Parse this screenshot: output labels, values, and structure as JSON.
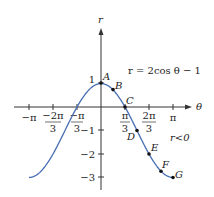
{
  "chart_data": {
    "type": "line",
    "title": "",
    "equation": "r = 2cos θ − 1",
    "xlabel": "θ",
    "ylabel": "r",
    "annotation": "r<0",
    "x_ticks": [
      {
        "value": -3.14159,
        "num": "−π",
        "den": ""
      },
      {
        "value": -2.0944,
        "num": "−2π",
        "den": "3"
      },
      {
        "value": -1.0472,
        "num": "−π",
        "den": "3"
      },
      {
        "value": 1.0472,
        "num": "π",
        "den": "3"
      },
      {
        "value": 2.0944,
        "num": "2π",
        "den": "3"
      },
      {
        "value": 3.14159,
        "num": "π",
        "den": ""
      }
    ],
    "y_ticks": [
      {
        "value": 1,
        "label": "1"
      },
      {
        "value": -1,
        "label": "−1"
      },
      {
        "value": -2,
        "label": "−2"
      },
      {
        "value": -3,
        "label": "−3"
      }
    ],
    "xlim": [
      -3.14159,
      3.14159
    ],
    "ylim": [
      -3,
      1
    ],
    "grid": false,
    "series": [
      {
        "name": "r = 2cos θ − 1",
        "color": "#4a6fb5",
        "function": "2*cos(theta)-1",
        "domain": [
          -3.14159,
          3.14159
        ]
      }
    ],
    "points": [
      {
        "label": "A",
        "theta": 0,
        "r": 1
      },
      {
        "label": "B",
        "theta": 0.5236,
        "r": 0.73
      },
      {
        "label": "C",
        "theta": 1.0472,
        "r": 0
      },
      {
        "label": "D",
        "theta": 1.5708,
        "r": -1
      },
      {
        "label": "E",
        "theta": 2.0944,
        "r": -2
      },
      {
        "label": "F",
        "theta": 2.618,
        "r": -2.73
      },
      {
        "label": "G",
        "theta": 3.14159,
        "r": -3
      }
    ]
  },
  "labels": {
    "theta_axis": "θ",
    "r_axis": "r",
    "equation": "r = 2cos θ − 1",
    "annotation": "r<0",
    "A": "A",
    "B": "B",
    "C": "C",
    "D": "D",
    "E": "E",
    "F": "F",
    "G": "G",
    "x_ticks": {
      "neg_pi": "−π",
      "neg_2pi_num": "−2π",
      "neg_pi3_num": "−π",
      "three": "3",
      "pi3_num": "π",
      "two_pi3_num": "2π",
      "pi": "π"
    },
    "y_ticks": {
      "one": "1",
      "neg1": "−1",
      "neg2": "−2",
      "neg3": "−3"
    }
  }
}
